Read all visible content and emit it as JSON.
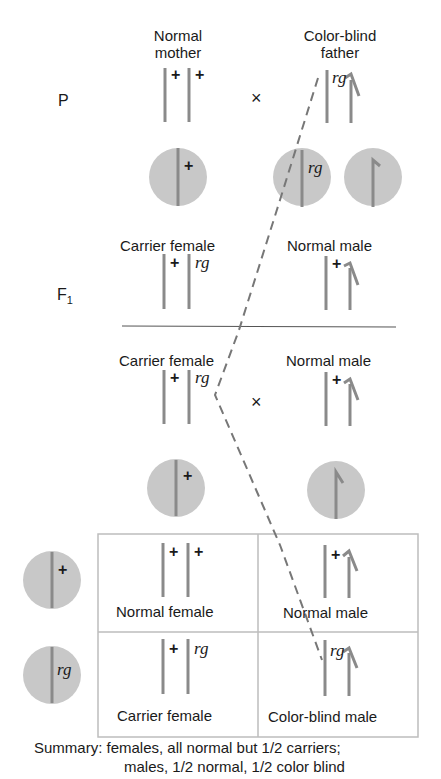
{
  "parents": {
    "generation_label": "P",
    "mother": {
      "label_line1": "Normal",
      "label_line2": "mother",
      "alleles": [
        "+",
        "+"
      ]
    },
    "father": {
      "label_line1": "Color-blind",
      "label_line2": "father",
      "alleles": [
        "rg"
      ]
    },
    "cross_symbol": "×",
    "mother_gametes": [
      {
        "allele": "+"
      }
    ],
    "father_gametes": [
      {
        "allele": "rg"
      },
      {
        "allele": "Y"
      }
    ]
  },
  "f1": {
    "generation_label": "F",
    "generation_sub": "1",
    "female": {
      "label": "Carrier female",
      "alleles": [
        "+",
        "rg"
      ]
    },
    "male": {
      "label": "Normal male",
      "alleles": [
        "+"
      ]
    }
  },
  "f1_cross": {
    "female": {
      "label": "Carrier female",
      "alleles": [
        "+",
        "rg"
      ]
    },
    "male": {
      "label": "Normal male",
      "alleles": [
        "+"
      ]
    },
    "cross_symbol": "×",
    "female_gamete": {
      "allele": "+"
    },
    "male_gamete": {
      "allele": "Y"
    }
  },
  "punnett": {
    "row_gametes": [
      "+",
      "rg"
    ],
    "cells": [
      {
        "alleles": [
          "+",
          "+"
        ],
        "label": "Normal female"
      },
      {
        "alleles": [
          "+"
        ],
        "label": "Normal male"
      },
      {
        "alleles": [
          "+",
          "rg"
        ],
        "label": "Carrier female"
      },
      {
        "alleles": [
          "rg"
        ],
        "label": "Color-blind male"
      }
    ]
  },
  "summary": {
    "line1": "Summary: females, all normal but 1/2 carriers;",
    "line2": "males, 1/2 normal, 1/2 color blind"
  },
  "colors": {
    "chromosome": "#8a8a8a",
    "gamete": "#c8c8c8",
    "line": "#555555",
    "dash": "#777777",
    "grid": "#bdbdbd"
  }
}
